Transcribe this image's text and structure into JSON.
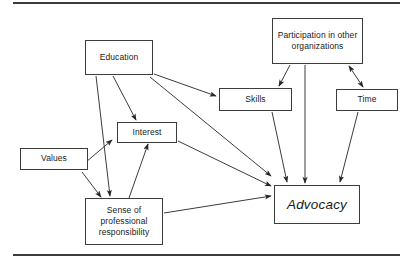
{
  "diagram": {
    "type": "concept-flow-diagram",
    "canvas": {
      "width": 414,
      "height": 264,
      "background": "#ffffff"
    },
    "stroke_color": "#3c3c3c",
    "rules": [
      {
        "name": "top-rule",
        "x": 13,
        "y": 2,
        "width": 387,
        "height": 2
      },
      {
        "name": "bottom-rule",
        "x": 13,
        "y": 254,
        "width": 387,
        "height": 2
      }
    ],
    "nodes": [
      {
        "id": "education",
        "label": "Education",
        "x": 85,
        "y": 40,
        "w": 68,
        "h": 35,
        "emphasis": false
      },
      {
        "id": "participation",
        "label": "Participation in other organizations",
        "x": 272,
        "y": 18,
        "w": 91,
        "h": 46,
        "emphasis": false
      },
      {
        "id": "skills",
        "label": "Skills",
        "x": 219,
        "y": 88,
        "w": 73,
        "h": 23,
        "emphasis": false
      },
      {
        "id": "time",
        "label": "Time",
        "x": 336,
        "y": 89,
        "w": 62,
        "h": 22,
        "emphasis": false
      },
      {
        "id": "interest",
        "label": "Interest",
        "x": 117,
        "y": 122,
        "w": 60,
        "h": 21,
        "emphasis": false
      },
      {
        "id": "values",
        "label": "Values",
        "x": 20,
        "y": 148,
        "w": 68,
        "h": 22,
        "emphasis": false
      },
      {
        "id": "sense",
        "label": "Sense of professional responsibility",
        "x": 85,
        "y": 198,
        "w": 78,
        "h": 47,
        "emphasis": false
      },
      {
        "id": "advocacy",
        "label": "Advocacy",
        "x": 274,
        "y": 185,
        "w": 86,
        "h": 39,
        "emphasis": true
      }
    ],
    "edges": [
      {
        "id": "education-to-sense",
        "from": "education",
        "to": "sense",
        "arrow": "single",
        "path": "M 96,76 L 110,196"
      },
      {
        "id": "education-to-interest",
        "from": "education",
        "to": "interest",
        "arrow": "single",
        "path": "M 113,76 L 136,120"
      },
      {
        "id": "education-to-skills",
        "from": "education",
        "to": "skills",
        "arrow": "single",
        "path": "M 154,74 L 216,96"
      },
      {
        "id": "education-to-advocacy",
        "from": "education",
        "to": "advocacy",
        "arrow": "single",
        "path": "M 150,77 L 271,176"
      },
      {
        "id": "values-to-interest",
        "from": "values",
        "to": "interest",
        "arrow": "single",
        "path": "M 86,162 L 112,140"
      },
      {
        "id": "values-to-sense",
        "from": "values",
        "to": "sense",
        "arrow": "single",
        "path": "M 82,172 L 101,197"
      },
      {
        "id": "sense-to-interest",
        "from": "sense",
        "to": "interest",
        "arrow": "single",
        "path": "M 129,198 L 148,144"
      },
      {
        "id": "interest-to-advocacy",
        "from": "interest",
        "to": "advocacy",
        "arrow": "single",
        "path": "M 178,141 L 271,186"
      },
      {
        "id": "sense-to-advocacy",
        "from": "sense",
        "to": "advocacy",
        "arrow": "single",
        "path": "M 164,213 L 271,196"
      },
      {
        "id": "participation-to-skills",
        "from": "participation",
        "to": "skills",
        "arrow": "single",
        "path": "M 290,65 L 279,86"
      },
      {
        "id": "participation-to-advocacy",
        "from": "participation",
        "to": "advocacy",
        "arrow": "single",
        "path": "M 305,65 L 305,183"
      },
      {
        "id": "participation-time-bidirectional",
        "from": "participation",
        "to": "time",
        "arrow": "double",
        "path": "M 349,66 L 363,87"
      },
      {
        "id": "skills-to-advocacy",
        "from": "skills",
        "to": "advocacy",
        "arrow": "single",
        "path": "M 272,112 L 287,182"
      },
      {
        "id": "time-to-advocacy",
        "from": "time",
        "to": "advocacy",
        "arrow": "single",
        "path": "M 358,112 L 340,182"
      }
    ]
  }
}
